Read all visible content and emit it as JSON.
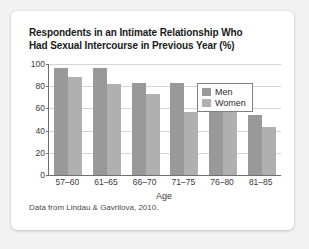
{
  "card": {
    "background_color": "#ffffff",
    "page_background_color": "#f2f2f2"
  },
  "title": {
    "line1": "Respondents in an Intimate Relationship Who",
    "line2": "Had Sexual Intercourse in Previous Year (%)"
  },
  "source_note": "Data from Lindau & Gavrilova, 2010.",
  "legend": {
    "position": "top-right",
    "items": [
      {
        "label": "Men",
        "color": "#999999"
      },
      {
        "label": "Women",
        "color": "#b0b0b0"
      }
    ]
  },
  "chart_data": {
    "type": "bar",
    "title": "Respondents in an Intimate Relationship Who Had Sexual Intercourse in Previous Year (%)",
    "xlabel": "Age",
    "ylabel": "",
    "categories": [
      "57–60",
      "61–65",
      "66–70",
      "71–75",
      "76–80",
      "81–85"
    ],
    "series": [
      {
        "name": "Men",
        "color": "#999999",
        "values": [
          96,
          96,
          83,
          83,
          58,
          54
        ]
      },
      {
        "name": "Women",
        "color": "#b0b0b0",
        "values": [
          88,
          82,
          73,
          57,
          59,
          43
        ]
      }
    ],
    "ylim": [
      0,
      100
    ],
    "yticks": [
      0,
      20,
      40,
      60,
      80,
      100
    ],
    "ytick_labels": [
      "0",
      "20",
      "40",
      "60",
      "80",
      "100"
    ],
    "grid": "horizontal",
    "legend_position": "top-right",
    "source": "Data from Lindau & Gavrilova, 2010."
  }
}
